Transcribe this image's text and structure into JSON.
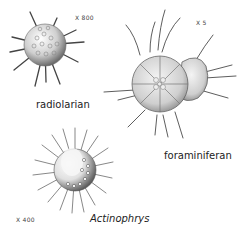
{
  "figures": [
    {
      "name": "radiolarian",
      "magnification": "X 800"
    },
    {
      "name": "foraminiferan",
      "magnification": "X 5"
    },
    {
      "name": "Actinophrys",
      "magnification": "X 400"
    }
  ],
  "colors": {
    "background": "#ffffff",
    "ink": "#222222",
    "shade": "#9a9a9a"
  }
}
